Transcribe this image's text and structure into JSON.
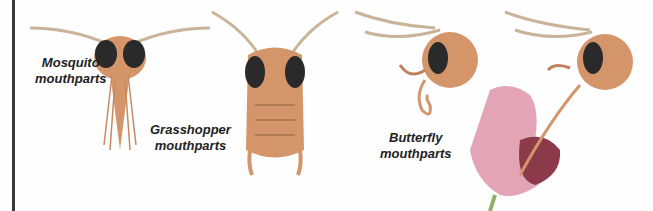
{
  "labels": {
    "mosquito": [
      "Mosquito",
      "mouthparts"
    ],
    "grasshopper": [
      "Grasshopper",
      "mouthparts"
    ],
    "butterfly": [
      "Butterfly",
      "mouthparts"
    ]
  },
  "colors": {
    "insect_body": "#d4956a",
    "insect_dark": "#8a5a3a",
    "eye": "#2a2a2a",
    "flower_pink": "#e3a5b5",
    "flower_dark": "#8c3a4a",
    "leaf_green": "#8fb06a",
    "antenna": "#c9b49a"
  }
}
